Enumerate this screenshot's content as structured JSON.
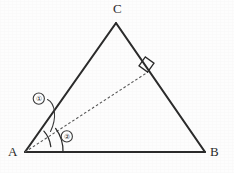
{
  "figure": {
    "background_color": "#fdfdfd",
    "stroke_color": "#2a2a2a",
    "dashed_stroke_color": "#555555",
    "vertices": [
      {
        "name": "A",
        "label": "A",
        "x": 25,
        "y": 152
      },
      {
        "name": "B",
        "label": "B",
        "x": 205,
        "y": 152
      },
      {
        "name": "C",
        "label": "C",
        "x": 116,
        "y": 23
      }
    ],
    "sides": [
      {
        "name": "side-AB",
        "from": "A",
        "to": "B",
        "style": "solid"
      },
      {
        "name": "side-AC",
        "from": "A",
        "to": "C",
        "style": "solid"
      },
      {
        "name": "side-BC",
        "from": "B",
        "to": "C",
        "style": "solid"
      }
    ],
    "altitude": {
      "name": "altitude-A-to-BC",
      "from": "A",
      "foot_x": 148,
      "foot_y": 72,
      "style": "dashed",
      "right_angle_marker": true
    },
    "right_angle_marker": {
      "label": "right-angle-square",
      "size": 11
    },
    "angle_marks": [
      {
        "name": "angle-1",
        "label": "①",
        "between": "AC and altitude",
        "arc_radius": 28,
        "callout_x": 39,
        "callout_y": 99
      },
      {
        "name": "angle-2",
        "label": "②",
        "between": "AB and altitude",
        "arc_radius": 38,
        "callout_x": 67,
        "callout_y": 136
      }
    ]
  }
}
